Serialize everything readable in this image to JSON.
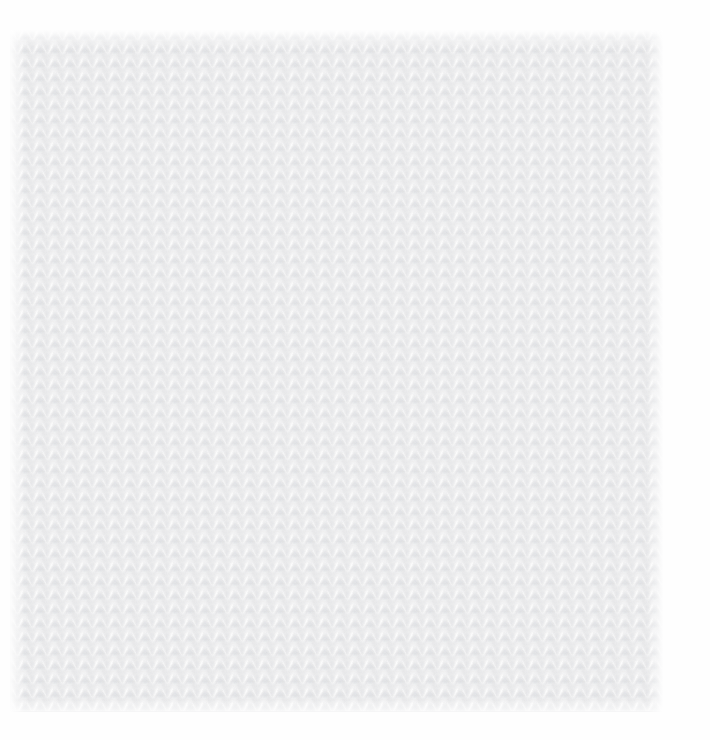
{
  "image": {
    "subject": "knitted fabric texture swatch",
    "material": "white knitted wool fabric",
    "stitch_pattern": "stockinette stitch",
    "canvas": {
      "width": 710,
      "height": 740
    }
  },
  "background": {
    "color": "#fefefe"
  },
  "fabric_panel": {
    "left": 10,
    "top": 30,
    "width": 653,
    "height": 682,
    "base_color": "#f1f1f2",
    "highlight_color": "#ffffff",
    "shadow_color": "#e4e5e8",
    "valley_color": "#e8e9ea"
  },
  "stitch": {
    "column_repeat_px": 15,
    "row_repeat_px": 14,
    "columns": 44,
    "rows": 49,
    "shape": "v-shaped pair of elongated leaf strokes",
    "alignment": "columns vertically aligned, no row offset"
  },
  "lighting": {
    "direction": "diffuse, slightly from upper-left",
    "contrast": "very low"
  }
}
